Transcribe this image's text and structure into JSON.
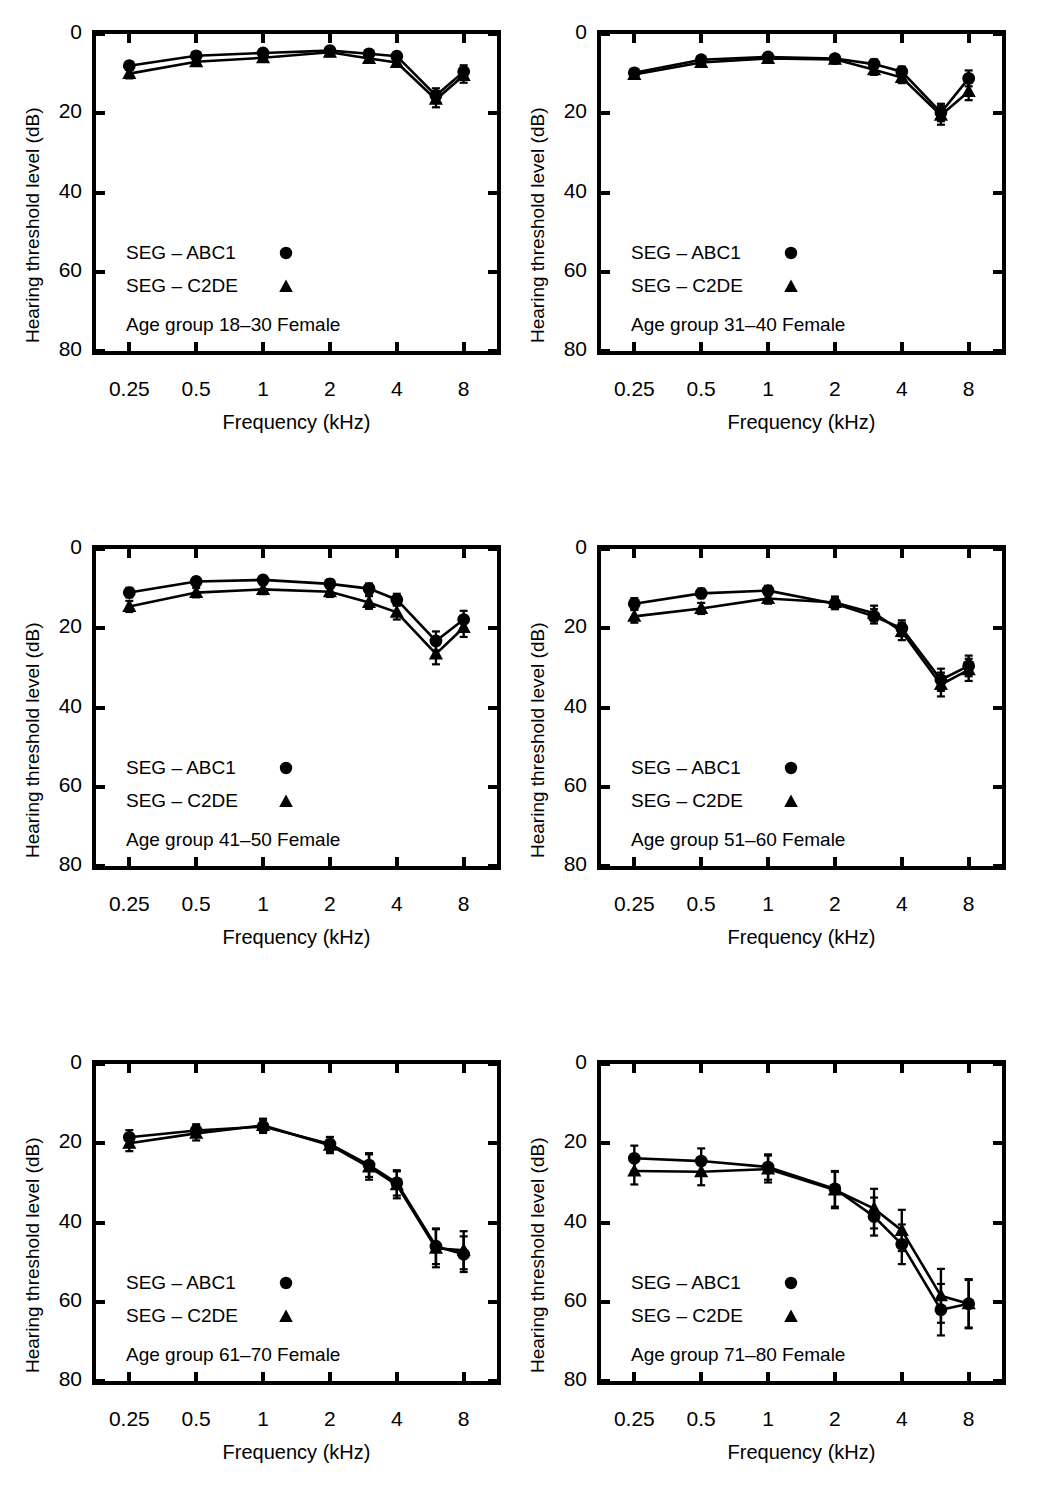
{
  "figure": {
    "kind": "multi-panel-audiogram-figure",
    "rows": 3,
    "cols": 2,
    "series_colors": {
      "abc1": "#000000",
      "c2de": "#000000"
    },
    "background": "#ffffff"
  },
  "axes_common": {
    "ylabel": "Hearing threshold level (dB)",
    "xlabel": "Frequency (kHz)",
    "ytick_labels": [
      "0",
      "20",
      "40",
      "60",
      "80"
    ],
    "ytick_values": [
      0,
      20,
      40,
      60,
      80
    ],
    "ylim": [
      0,
      80
    ],
    "y_inverted": true,
    "xtick_labels": [
      "0.25",
      "0.5",
      "1",
      "2",
      "4",
      "8"
    ],
    "xtick_values": [
      0.25,
      0.5,
      1,
      2,
      4,
      8
    ],
    "xlim": [
      0.177,
      11.3
    ],
    "x_scale": "log2",
    "minor_xticks": [
      3,
      6
    ],
    "grid": false
  },
  "legend_common": {
    "entries": [
      {
        "label": "SEG – ABC1",
        "marker": "circle"
      },
      {
        "label": "SEG – C2DE",
        "marker": "triangle"
      }
    ]
  },
  "chart_data": [
    {
      "panel_index": 0,
      "type": "line",
      "title": "Age group 18–30 Female",
      "xlabel": "Frequency (kHz)",
      "ylabel": "Hearing threshold level (dB)",
      "ylim": [
        0,
        80
      ],
      "y_inverted": true,
      "x": [
        0.25,
        0.5,
        1,
        2,
        3,
        4,
        6,
        8
      ],
      "series": [
        {
          "name": "SEG – ABC1",
          "marker": "circle",
          "values": [
            8.0,
            5.5,
            4.8,
            4.2,
            5.0,
            5.6,
            15.5,
            9.5
          ],
          "err": [
            1.0,
            0.9,
            0.9,
            0.9,
            1.0,
            1.0,
            1.8,
            1.6
          ]
        },
        {
          "name": "SEG – C2DE",
          "marker": "triangle",
          "values": [
            10.0,
            7.0,
            6.0,
            4.6,
            6.2,
            7.2,
            16.5,
            10.5
          ],
          "err": [
            1.2,
            1.0,
            1.0,
            1.0,
            1.1,
            1.1,
            2.0,
            1.8
          ]
        }
      ]
    },
    {
      "panel_index": 1,
      "type": "line",
      "title": "Age group 31–40 Female",
      "xlabel": "Frequency (kHz)",
      "ylabel": "Hearing threshold level (dB)",
      "ylim": [
        0,
        80
      ],
      "y_inverted": true,
      "x": [
        0.25,
        0.5,
        1,
        2,
        3,
        4,
        6,
        8
      ],
      "series": [
        {
          "name": "SEG – ABC1",
          "marker": "circle",
          "values": [
            9.8,
            6.5,
            5.8,
            6.2,
            7.6,
            9.5,
            19.8,
            11.2
          ],
          "err": [
            1.0,
            0.9,
            0.9,
            0.9,
            1.2,
            1.3,
            2.2,
            2.0
          ]
        },
        {
          "name": "SEG – C2DE",
          "marker": "triangle",
          "values": [
            10.2,
            7.2,
            6.2,
            6.4,
            9.0,
            11.0,
            20.5,
            14.5
          ],
          "err": [
            1.1,
            1.0,
            1.0,
            1.0,
            1.3,
            1.4,
            2.4,
            2.2
          ]
        }
      ]
    },
    {
      "panel_index": 2,
      "type": "line",
      "title": "Age group 41–50 Female",
      "xlabel": "Frequency (kHz)",
      "ylabel": "Hearing threshold level (dB)",
      "ylim": [
        0,
        80
      ],
      "y_inverted": true,
      "x": [
        0.25,
        0.5,
        1,
        2,
        3,
        4,
        6,
        8
      ],
      "series": [
        {
          "name": "SEG – ABC1",
          "marker": "circle",
          "values": [
            11.0,
            8.2,
            7.8,
            8.8,
            10.0,
            12.8,
            23.2,
            17.8
          ],
          "err": [
            1.2,
            1.0,
            1.0,
            1.1,
            1.3,
            1.5,
            2.4,
            2.2
          ]
        },
        {
          "name": "SEG – C2DE",
          "marker": "triangle",
          "values": [
            14.5,
            11.0,
            10.2,
            10.8,
            13.5,
            16.0,
            26.5,
            19.8
          ],
          "err": [
            1.4,
            1.2,
            1.2,
            1.3,
            1.6,
            1.8,
            2.6,
            2.4
          ]
        }
      ]
    },
    {
      "panel_index": 3,
      "type": "line",
      "title": "Age group 51–60 Female",
      "xlabel": "Frequency (kHz)",
      "ylabel": "Hearing threshold level (dB)",
      "ylim": [
        0,
        80
      ],
      "y_inverted": true,
      "x": [
        0.25,
        0.5,
        1,
        2,
        3,
        4,
        6,
        8
      ],
      "series": [
        {
          "name": "SEG – ABC1",
          "marker": "circle",
          "values": [
            13.8,
            11.2,
            10.5,
            13.8,
            17.0,
            20.0,
            33.0,
            29.5
          ],
          "err": [
            1.4,
            1.2,
            1.2,
            1.4,
            1.8,
            2.0,
            2.8,
            2.6
          ]
        },
        {
          "name": "SEG – C2DE",
          "marker": "triangle",
          "values": [
            17.0,
            15.0,
            12.5,
            13.5,
            16.2,
            20.8,
            34.2,
            30.5
          ],
          "err": [
            1.6,
            1.4,
            1.3,
            1.5,
            1.9,
            2.2,
            3.0,
            2.8
          ]
        }
      ]
    },
    {
      "panel_index": 4,
      "type": "line",
      "title": "Age group 61–70 Female",
      "xlabel": "Frequency (kHz)",
      "ylabel": "Hearing threshold level (dB)",
      "ylim": [
        0,
        80
      ],
      "y_inverted": true,
      "x": [
        0.25,
        0.5,
        1,
        2,
        3,
        4,
        6,
        8
      ],
      "series": [
        {
          "name": "SEG – ABC1",
          "marker": "circle",
          "values": [
            18.5,
            16.8,
            15.8,
            20.2,
            25.5,
            30.0,
            46.0,
            48.0
          ],
          "err": [
            1.8,
            1.6,
            1.6,
            1.8,
            3.0,
            3.2,
            4.5,
            4.5
          ]
        },
        {
          "name": "SEG – C2DE",
          "marker": "triangle",
          "values": [
            20.0,
            17.5,
            15.5,
            20.5,
            26.0,
            30.5,
            46.5,
            47.0
          ],
          "err": [
            2.0,
            1.8,
            1.7,
            2.0,
            3.2,
            3.4,
            4.8,
            4.8
          ]
        }
      ]
    },
    {
      "panel_index": 5,
      "type": "line",
      "title": "Age group 71–80 Female",
      "xlabel": "Frequency (kHz)",
      "ylabel": "Hearing threshold level (dB)",
      "ylim": [
        0,
        80
      ],
      "y_inverted": true,
      "x": [
        0.25,
        0.5,
        1,
        2,
        3,
        4,
        6,
        8
      ],
      "series": [
        {
          "name": "SEG – ABC1",
          "marker": "circle",
          "values": [
            23.8,
            24.5,
            26.0,
            31.5,
            38.5,
            45.5,
            62.0,
            60.5
          ],
          "err": [
            3.2,
            3.2,
            3.2,
            4.5,
            4.8,
            5.0,
            6.5,
            6.0
          ]
        },
        {
          "name": "SEG – C2DE",
          "marker": "triangle",
          "values": [
            27.0,
            27.2,
            26.5,
            31.8,
            36.5,
            42.0,
            58.5,
            60.5
          ],
          "err": [
            3.4,
            3.4,
            3.4,
            4.6,
            5.0,
            5.2,
            6.8,
            6.2
          ]
        }
      ]
    }
  ]
}
